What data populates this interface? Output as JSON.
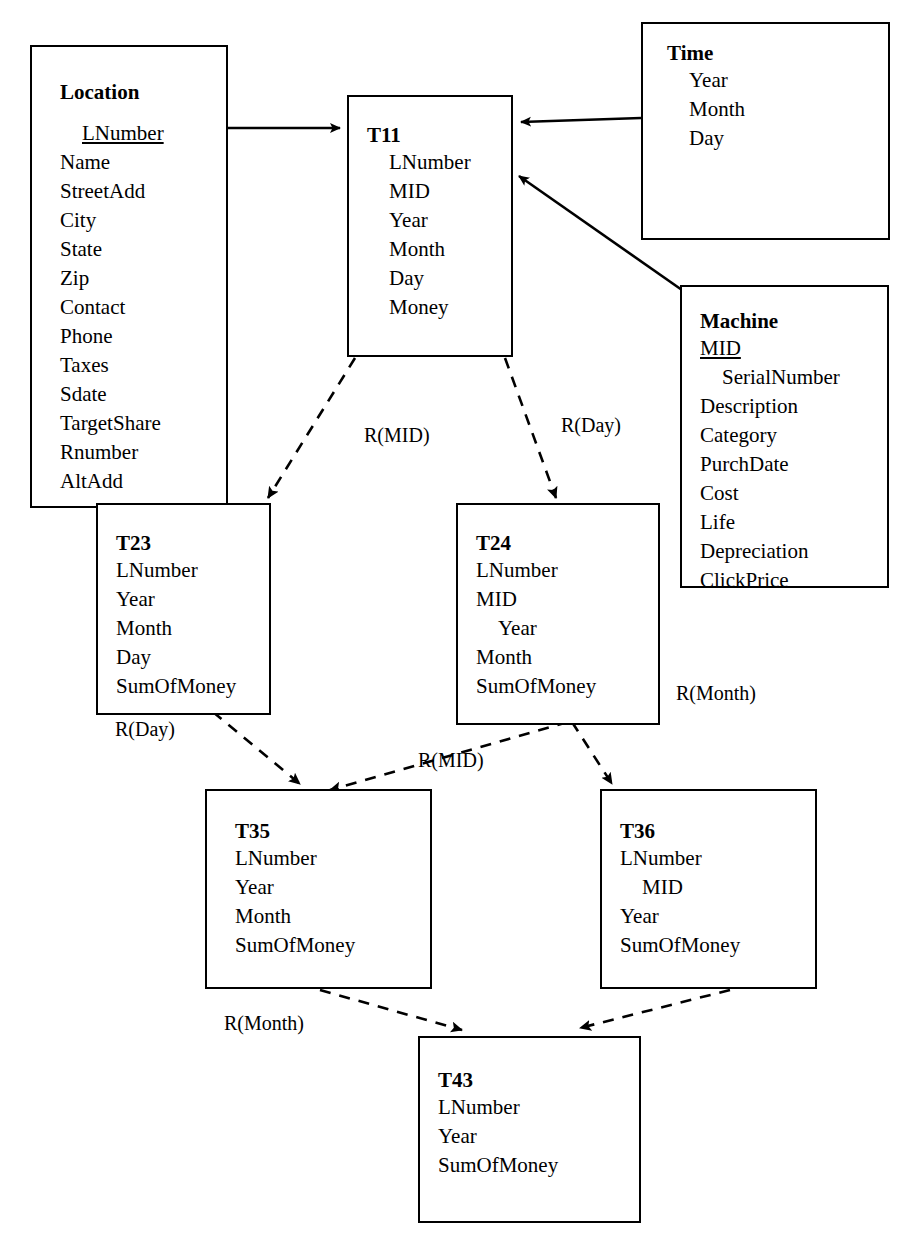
{
  "diagram": {
    "background_color": "#ffffff",
    "line_color": "#000000"
  },
  "entities": [
    {
      "id": "location",
      "name": "Location",
      "attributes": [
        {
          "label": "LNumber",
          "pk": true,
          "indent": true
        },
        {
          "label": "Name",
          "pk": false,
          "indent": false
        },
        {
          "label": "StreetAdd",
          "pk": false,
          "indent": false
        },
        {
          "label": "City",
          "pk": false,
          "indent": false
        },
        {
          "label": "State",
          "pk": false,
          "indent": false
        },
        {
          "label": "Zip",
          "pk": false,
          "indent": false
        },
        {
          "label": "Contact",
          "pk": false,
          "indent": false
        },
        {
          "label": "Phone",
          "pk": false,
          "indent": false
        },
        {
          "label": "Taxes",
          "pk": false,
          "indent": false
        },
        {
          "label": "Sdate",
          "pk": false,
          "indent": false
        },
        {
          "label": "TargetShare",
          "pk": false,
          "indent": false
        },
        {
          "label": "Rnumber",
          "pk": false,
          "indent": false
        },
        {
          "label": "AltAdd",
          "pk": false,
          "indent": false
        }
      ]
    },
    {
      "id": "time",
      "name": "Time",
      "attributes": [
        {
          "label": "Year",
          "pk": false,
          "indent": false
        },
        {
          "label": "Month",
          "pk": false,
          "indent": false
        },
        {
          "label": "Day",
          "pk": false,
          "indent": false
        }
      ]
    },
    {
      "id": "machine",
      "name": "Machine",
      "attributes": [
        {
          "label": "MID",
          "pk": true,
          "indent": false
        },
        {
          "label": "SerialNumber",
          "pk": false,
          "indent": true
        },
        {
          "label": "Description",
          "pk": false,
          "indent": false
        },
        {
          "label": "Category",
          "pk": false,
          "indent": false
        },
        {
          "label": "PurchDate",
          "pk": false,
          "indent": false
        },
        {
          "label": "Cost",
          "pk": false,
          "indent": false
        },
        {
          "label": "Life",
          "pk": false,
          "indent": false
        },
        {
          "label": "Depreciation",
          "pk": false,
          "indent": false
        },
        {
          "label": "ClickPrice",
          "pk": false,
          "indent": false
        }
      ]
    },
    {
      "id": "t11",
      "name": "T11",
      "attributes": [
        {
          "label": "LNumber",
          "pk": false,
          "indent": true
        },
        {
          "label": "MID",
          "pk": false,
          "indent": true
        },
        {
          "label": "Year",
          "pk": false,
          "indent": true
        },
        {
          "label": "Month",
          "pk": false,
          "indent": true
        },
        {
          "label": "Day",
          "pk": false,
          "indent": true
        },
        {
          "label": "Money",
          "pk": false,
          "indent": true
        }
      ]
    },
    {
      "id": "t23",
      "name": "T23",
      "attributes": [
        {
          "label": "LNumber",
          "pk": false,
          "indent": false
        },
        {
          "label": "Year",
          "pk": false,
          "indent": false
        },
        {
          "label": "Month",
          "pk": false,
          "indent": false
        },
        {
          "label": "Day",
          "pk": false,
          "indent": false
        },
        {
          "label": "SumOfMoney",
          "pk": false,
          "indent": false
        }
      ]
    },
    {
      "id": "t24",
      "name": "T24",
      "attributes": [
        {
          "label": "LNumber",
          "pk": false,
          "indent": false
        },
        {
          "label": "MID",
          "pk": false,
          "indent": false
        },
        {
          "label": "Year",
          "pk": false,
          "indent": true
        },
        {
          "label": "Month",
          "pk": false,
          "indent": false
        },
        {
          "label": "SumOfMoney",
          "pk": false,
          "indent": false
        }
      ]
    },
    {
      "id": "t35",
      "name": "T35",
      "attributes": [
        {
          "label": "LNumber",
          "pk": false,
          "indent": false
        },
        {
          "label": "Year",
          "pk": false,
          "indent": false
        },
        {
          "label": "Month",
          "pk": false,
          "indent": false
        },
        {
          "label": "SumOfMoney",
          "pk": false,
          "indent": false
        }
      ]
    },
    {
      "id": "t36",
      "name": "T36",
      "attributes": [
        {
          "label": "LNumber",
          "pk": false,
          "indent": false
        },
        {
          "label": "MID",
          "pk": false,
          "indent": true
        },
        {
          "label": "Year",
          "pk": false,
          "indent": false
        },
        {
          "label": "SumOfMoney",
          "pk": false,
          "indent": false
        }
      ]
    },
    {
      "id": "t43",
      "name": "T43",
      "attributes": [
        {
          "label": "LNumber",
          "pk": false,
          "indent": false
        },
        {
          "label": "Year",
          "pk": false,
          "indent": false
        },
        {
          "label": "SumOfMoney",
          "pk": false,
          "indent": false
        }
      ]
    }
  ],
  "edge_labels": [
    {
      "id": "lbl-mid-t23",
      "text": "R(MID)"
    },
    {
      "id": "lbl-day-t24",
      "text": "R(Day)"
    },
    {
      "id": "lbl-day-t35",
      "text": "R(Day)"
    },
    {
      "id": "lbl-mid-t35",
      "text": "R(MID)"
    },
    {
      "id": "lbl-month-t36",
      "text": "R(Month)"
    },
    {
      "id": "lbl-month-t43",
      "text": "R(Month)"
    }
  ]
}
